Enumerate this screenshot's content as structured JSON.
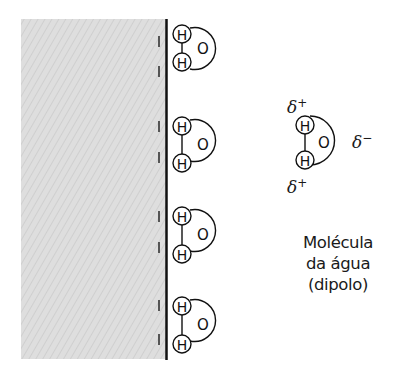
{
  "diagram": {
    "surface": {
      "fill_color": "#dcdcdc",
      "border_color": "#111111",
      "charge_symbol": "|",
      "charge_positions_y": [
        42,
        70,
        127,
        157,
        217,
        247,
        305,
        339
      ]
    },
    "atoms": {
      "hydrogen": "H",
      "oxygen": "O"
    },
    "surface_molecules": [
      {
        "h1_y": 34,
        "h2_y": 62
      },
      {
        "h1_y": 126,
        "h2_y": 163
      },
      {
        "h1_y": 216,
        "h2_y": 254
      },
      {
        "h1_y": 306,
        "h2_y": 344
      }
    ],
    "dipole_molecule": {
      "delta_plus_top": "δ",
      "delta_plus_top_sign": "+",
      "delta_minus": "δ",
      "delta_minus_sign": "−",
      "delta_plus_bottom": "δ",
      "delta_plus_bottom_sign": "+"
    },
    "caption": {
      "line1": "Molécula",
      "line2": "da água",
      "line3": "(dipolo)"
    }
  }
}
